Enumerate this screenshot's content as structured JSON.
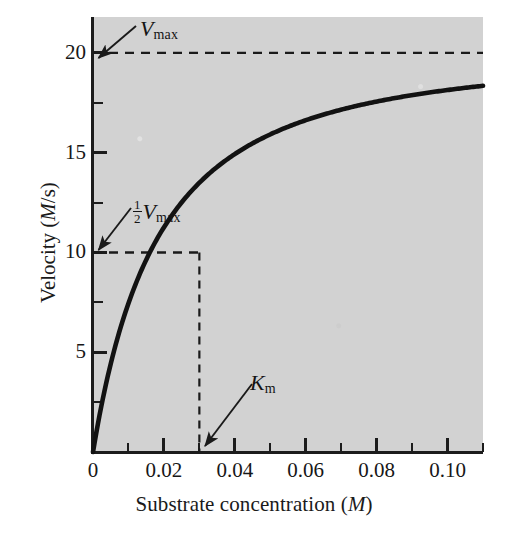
{
  "figure": {
    "name": "michaelis-menten-plot",
    "background_color": "#ffffff",
    "plot_area_color": "#d2d2d2",
    "ink_color": "#1a1a1a"
  },
  "axes": {
    "x": {
      "title_text": "Substrate concentration (",
      "title_italic": "M",
      "title_close": ")",
      "major_ticks": [
        "0",
        "0.02",
        "0.04",
        "0.06",
        "0.08",
        "0.10"
      ],
      "major_values": [
        0,
        0.02,
        0.04,
        0.06,
        0.08,
        0.1
      ],
      "minor_values": [
        0.01,
        0.03,
        0.05,
        0.07,
        0.09,
        0.11
      ],
      "range": [
        0,
        0.11
      ]
    },
    "y": {
      "title_text": "Velocity (",
      "title_italic": "M",
      "title_close": "/s)",
      "major_ticks": [
        "5",
        "10",
        "15",
        "20"
      ],
      "major_values": [
        5,
        10,
        15,
        20
      ],
      "minor_values": [
        2.5,
        7.5,
        12.5,
        17.5
      ],
      "range": [
        0,
        21.8
      ]
    }
  },
  "annotations": {
    "vmax": {
      "label_var": "V",
      "label_sub": "max",
      "points_to_value": 20
    },
    "half_vmax": {
      "frac_num": "1",
      "frac_den": "2",
      "label_var": "V",
      "label_sub": "max",
      "points_to_value": 10
    },
    "km": {
      "label_var": "K",
      "label_sub": "m",
      "points_to_value": 0.03
    }
  },
  "chart_data": {
    "type": "line",
    "title": "",
    "xlabel": "Substrate concentration (M)",
    "ylabel": "Velocity (M/s)",
    "xlim": [
      0,
      0.11
    ],
    "ylim": [
      0,
      21.8
    ],
    "grid": false,
    "legend": null,
    "model": "Michaelis-Menten",
    "equation": "v = Vmax * S / (Km + S)",
    "parameters": {
      "Vmax": 20,
      "Km": 0.03
    },
    "series": [
      {
        "name": "velocity",
        "x": [
          0,
          0.005,
          0.01,
          0.015,
          0.02,
          0.025,
          0.03,
          0.035,
          0.04,
          0.05,
          0.06,
          0.07,
          0.08,
          0.09,
          0.1,
          0.11
        ],
        "y": [
          0,
          2.86,
          5.0,
          6.67,
          8.0,
          9.09,
          10.0,
          10.77,
          11.43,
          12.5,
          13.33,
          14.0,
          14.55,
          15.0,
          15.38,
          15.71
        ]
      }
    ],
    "reference_lines": [
      {
        "name": "vmax-dashed",
        "orientation": "horizontal",
        "value": 20,
        "style": "dashed"
      },
      {
        "name": "half-vmax-dashed",
        "orientation": "horizontal",
        "value": 10,
        "x_to": 0.03,
        "style": "dashed"
      },
      {
        "name": "km-dashed",
        "orientation": "vertical",
        "value": 0.03,
        "y_to": 10,
        "style": "dashed"
      }
    ]
  }
}
